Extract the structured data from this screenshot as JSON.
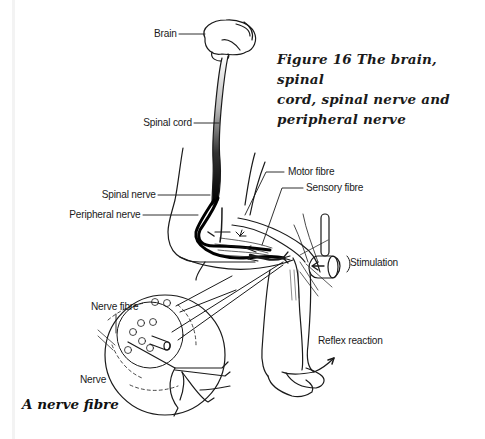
{
  "figure": {
    "caption_lines": [
      "Figure 16 The brain, spinal",
      "cord, spinal nerve and",
      "peripheral nerve"
    ],
    "inset_caption": "A nerve fibre"
  },
  "labels": {
    "brain": "Brain",
    "spinal_cord": "Spinal cord",
    "spinal_nerve": "Spinal nerve",
    "peripheral_nerve": "Peripheral nerve",
    "motor_fibre": "Motor fibre",
    "sensory_fibre": "Sensory fibre",
    "stimulation": "Stimulation",
    "reflex_reaction": "Reflex reaction",
    "nerve_fibre": "Nerve fibre",
    "nerve": "Nerve"
  },
  "colors": {
    "ink": "#1a1a1a",
    "background": "#ffffff"
  }
}
